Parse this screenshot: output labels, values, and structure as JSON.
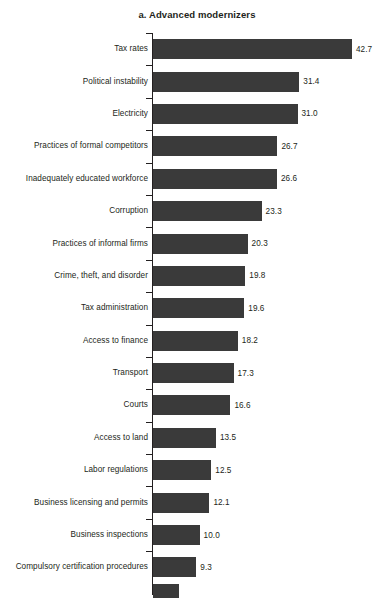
{
  "chart_data": {
    "type": "bar",
    "orientation": "horizontal",
    "title": "a. Advanced modernizers",
    "xlabel": "",
    "ylabel": "",
    "grid": false,
    "legend": null,
    "xlim": [
      0,
      42.7
    ],
    "categories": [
      "Tax rates",
      "Political instability",
      "Electricity",
      "Practices of formal competitors",
      "Inadequately educated workforce",
      "Corruption",
      "Practices of informal firms",
      "Crime, theft, and disorder",
      "Tax administration",
      "Access to finance",
      "Transport",
      "Courts",
      "Access to land",
      "Labor regulations",
      "Business licensing and permits",
      "Business inspections",
      "Compulsory certification procedures"
    ],
    "values": [
      42.7,
      31.4,
      31.0,
      26.7,
      26.6,
      23.3,
      20.3,
      19.8,
      19.6,
      18.2,
      17.3,
      16.6,
      13.5,
      12.5,
      12.1,
      10.0,
      9.3
    ],
    "value_labels": [
      "42.7",
      "31.4",
      "31.0",
      "26.7",
      "26.6",
      "23.3",
      "20.3",
      "19.8",
      "19.6",
      "18.2",
      "17.3",
      "16.6",
      "13.5",
      "12.5",
      "12.1",
      "10.0",
      "9.3"
    ],
    "bar_color": "#3a3a3a",
    "text_color": "#231f20",
    "background": "#ffffff",
    "clipped_bottom_bar": {
      "visible": true,
      "note": "partial bar cropped at bottom edge of image"
    }
  }
}
